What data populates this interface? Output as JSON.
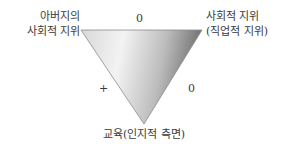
{
  "nodes": {
    "father_status": [
      "아버지의",
      "사회적 지위"
    ],
    "social_status": [
      "사회적 지위",
      "(직업적 지위)"
    ],
    "education": "교육(인지적 측면)"
  },
  "edges": {
    "father_to_social": "0",
    "father_to_education": "+",
    "social_to_education": "0"
  },
  "colors": {
    "triangle_light": "#f2f2f2",
    "triangle_dark": "#7a7a7a",
    "triangle_stroke": "#8c8c8c"
  }
}
